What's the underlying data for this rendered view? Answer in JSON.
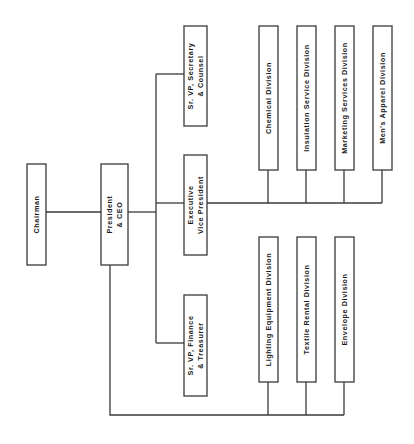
{
  "diagram": {
    "type": "org-chart",
    "orientation": "rotated-90-ccw",
    "colors": {
      "line": "#3a3a3a",
      "text": "#1a1a1a",
      "box_fill": "#ffffff",
      "background": "#ffffff"
    },
    "nodes": [
      {
        "id": "chairman",
        "lines": [
          "Chairman"
        ]
      },
      {
        "id": "president",
        "lines": [
          "President",
          "& CEO"
        ]
      },
      {
        "id": "svp-secretary",
        "lines": [
          "Sr. VP, Secretary",
          "& Counsel"
        ]
      },
      {
        "id": "evp",
        "lines": [
          "Executive",
          "Vice President"
        ]
      },
      {
        "id": "svp-finance",
        "lines": [
          "Sr. VP, Finance",
          "& Treasurer"
        ]
      },
      {
        "id": "chemical",
        "lines": [
          "Chemical Division"
        ]
      },
      {
        "id": "insulation",
        "lines": [
          "Insulation Service Division"
        ]
      },
      {
        "id": "marketing",
        "lines": [
          "Marketing Services Division"
        ]
      },
      {
        "id": "mens-apparel",
        "lines": [
          "Men's Apparel Division"
        ]
      },
      {
        "id": "lighting",
        "lines": [
          "Lighting Equipment Division"
        ]
      },
      {
        "id": "textile",
        "lines": [
          "Textile Rental Division"
        ]
      },
      {
        "id": "envelope",
        "lines": [
          "Envelope Division"
        ]
      }
    ],
    "edges": [
      {
        "from": "chairman",
        "to": "president"
      },
      {
        "from": "president",
        "to": "svp-secretary"
      },
      {
        "from": "president",
        "to": "evp"
      },
      {
        "from": "president",
        "to": "svp-finance"
      },
      {
        "from": "evp",
        "to": "chemical"
      },
      {
        "from": "evp",
        "to": "insulation"
      },
      {
        "from": "evp",
        "to": "marketing"
      },
      {
        "from": "evp",
        "to": "mens-apparel"
      },
      {
        "from": "president",
        "to": "lighting"
      },
      {
        "from": "president",
        "to": "textile"
      },
      {
        "from": "president",
        "to": "envelope"
      }
    ]
  }
}
